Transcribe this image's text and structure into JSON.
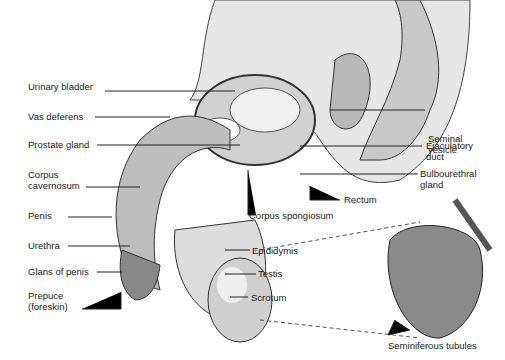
{
  "figure": {
    "type": "anatomical diagram"
  },
  "labels_left": [
    {
      "text": "Urinary bladder",
      "x": 28,
      "y": 20
    },
    {
      "text": "Vas deferens",
      "x": 28,
      "y": 41
    },
    {
      "text": "Prostate gland",
      "x": 28,
      "y": 68
    },
    {
      "text": "Corpus\ncavernosum",
      "x": 28,
      "y": 95
    },
    {
      "text": "Penis",
      "x": 28,
      "y": 143
    },
    {
      "text": "Urethra",
      "x": 28,
      "y": 174
    },
    {
      "text": "Glans of penis",
      "x": 28,
      "y": 199
    },
    {
      "text": "Prepuce\n(foreskin)",
      "x": 28,
      "y": 224
    }
  ],
  "labels_right": [
    {
      "text": "Seminal\nvesicle",
      "x": 430,
      "y": 56
    },
    {
      "text": "Ejaculatory\nduct",
      "x": 426,
      "y": 91
    },
    {
      "text": "Bulbourethral\ngland",
      "x": 420,
      "y": 118
    },
    {
      "text": "Rectum",
      "x": 345,
      "y": 152
    },
    {
      "text": "Corpus spongiosum",
      "x": 248,
      "y": 168
    },
    {
      "text": "Epididymis",
      "x": 251,
      "y": 194
    },
    {
      "text": "Testis",
      "x": 256,
      "y": 216
    },
    {
      "text": "Scrotum",
      "x": 250,
      "y": 239
    },
    {
      "text": "Seminiferous tubules",
      "x": 388,
      "y": 340
    }
  ]
}
